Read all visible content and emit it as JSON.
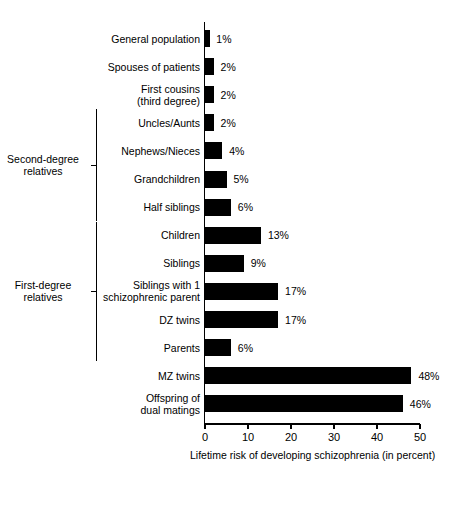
{
  "chart_data": {
    "type": "bar",
    "orientation": "horizontal",
    "title": "",
    "xlabel": "Lifetime risk of developing schizophrenia (in percent)",
    "ylabel": "",
    "xlim": [
      0,
      50
    ],
    "xticks": [
      0,
      10,
      20,
      30,
      40,
      50
    ],
    "xtick_labels": [
      "0",
      "10",
      "20",
      "30",
      "40",
      "50"
    ],
    "grid": false,
    "legend": false,
    "bar_color": "#000000",
    "categories": [
      "General population",
      "Spouses of patients",
      "First cousins\n(third degree)",
      "Uncles/Aunts",
      "Nephews/Nieces",
      "Grandchildren",
      "Half siblings",
      "Children",
      "Siblings",
      "Siblings with 1\nschizophrenic parent",
      "DZ twins",
      "Parents",
      "MZ twins",
      "Offspring of\ndual matings"
    ],
    "values": [
      1,
      2,
      2,
      2,
      4,
      5,
      6,
      13,
      9,
      17,
      17,
      6,
      48,
      46
    ],
    "value_labels": [
      "1%",
      "2%",
      "2%",
      "2%",
      "4%",
      "5%",
      "6%",
      "13%",
      "9%",
      "17%",
      "17%",
      "6%",
      "48%",
      "46%"
    ],
    "groups": [
      {
        "label": "Second-degree\nrelatives",
        "first_index": 3,
        "last_index": 6
      },
      {
        "label": "First-degree\nrelatives",
        "first_index": 7,
        "last_index": 11
      }
    ]
  }
}
